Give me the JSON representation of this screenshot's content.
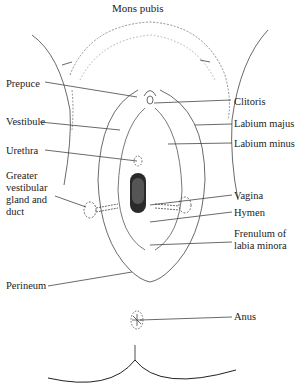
{
  "title": "Mons pubis",
  "labels": {
    "mons_pubis": "Mons pubis",
    "prepuce": "Prepuce",
    "clitoris": "Clitoris",
    "vestibule": "Vestibule",
    "labium_majus": "Labium majus",
    "urethra": "Urethra",
    "labium_minus": "Labium minus",
    "greater_vestibular_1": "Greater",
    "greater_vestibular_2": "vestibular",
    "greater_vestibular_3": "gland and",
    "greater_vestibular_4": "duct",
    "vagina": "Vagina",
    "hymen": "Hymen",
    "frenulum_1": "Frenulum of",
    "frenulum_2": "labia minora",
    "perineum": "Perineum",
    "anus": "Anus"
  },
  "colors": {
    "line": "#333333",
    "background": "#ffffff"
  }
}
